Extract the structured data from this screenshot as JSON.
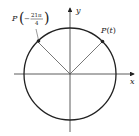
{
  "diagram": {
    "type": "unit-circle",
    "axes": {
      "x_label": "x",
      "y_label": "y"
    },
    "points": [
      {
        "label_prefix": "P",
        "label_arg": "t",
        "angle_deg": 45,
        "full_label": "P(t)"
      },
      {
        "label_prefix": "P",
        "numerator": "21π",
        "denominator": "4",
        "sign": "−",
        "angle_deg": 135,
        "full_label": "P(−21π/4)"
      }
    ],
    "colors": {
      "stroke": "#222222",
      "radius_line": "#555555"
    }
  }
}
